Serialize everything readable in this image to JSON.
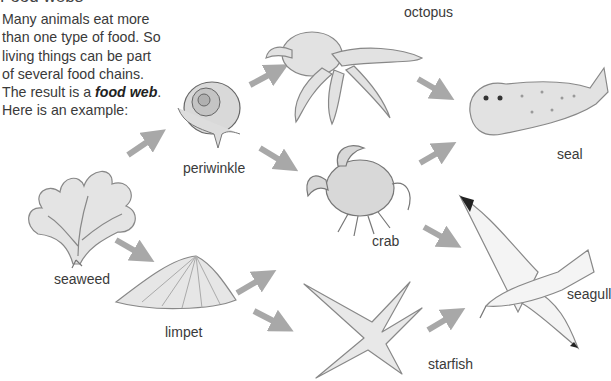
{
  "title": "Food webs",
  "intro": {
    "lines": [
      "Many animals eat more",
      "than one type of food. So",
      "living things can be part",
      "of several food chains."
    ],
    "result_prefix": "The result is a ",
    "result_term": "food web",
    "result_suffix": ".",
    "last_line": "Here is an example:"
  },
  "organisms": {
    "seaweed": "seaweed",
    "periwinkle": "periwinkle",
    "limpet": "limpet",
    "octopus": "octopus",
    "crab": "crab",
    "starfish": "starfish",
    "seal": "seal",
    "seagull": "seagull"
  },
  "links": [
    {
      "from": "seaweed",
      "to": "periwinkle"
    },
    {
      "from": "seaweed",
      "to": "limpet"
    },
    {
      "from": "periwinkle",
      "to": "octopus"
    },
    {
      "from": "periwinkle",
      "to": "crab"
    },
    {
      "from": "limpet",
      "to": "crab"
    },
    {
      "from": "limpet",
      "to": "starfish"
    },
    {
      "from": "octopus",
      "to": "seal"
    },
    {
      "from": "crab",
      "to": "seal"
    },
    {
      "from": "crab",
      "to": "seagull"
    },
    {
      "from": "starfish",
      "to": "seagull"
    }
  ],
  "colors": {
    "arrow": "#a8a8a8",
    "text": "#3a3a3a"
  }
}
